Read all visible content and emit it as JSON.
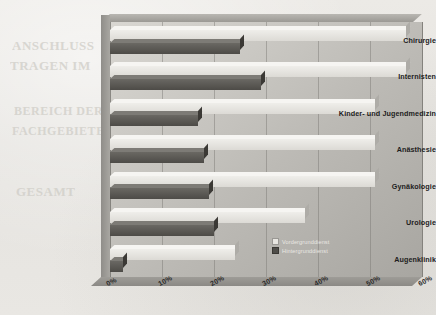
{
  "chart_data": {
    "type": "bar",
    "orientation": "horizontal",
    "title": "",
    "xlabel": "",
    "ylabel": "",
    "xlim": [
      0,
      60
    ],
    "xticks": [
      "0%",
      "10%",
      "20%",
      "30%",
      "40%",
      "50%",
      "60%"
    ],
    "xtick_values": [
      0,
      10,
      20,
      30,
      40,
      50,
      60
    ],
    "grid": true,
    "legend_position": "inside-right",
    "categories": [
      "Chirurgie",
      "Internisten",
      "Kinder- und Jugendmedizin",
      "Anästhesie",
      "Gynäkologie",
      "Urologie",
      "Augenklinik"
    ],
    "series": [
      {
        "name": "Vordergrunddienst",
        "color": "#e8e6e1",
        "values": [
          57,
          57,
          51,
          51,
          51,
          37.5,
          24
        ]
      },
      {
        "name": "Hintergrunddienst",
        "color": "#4f4d49",
        "values": [
          25,
          29,
          17,
          18,
          19,
          20,
          2.5
        ]
      }
    ]
  },
  "legend": {
    "items": [
      {
        "label": "Vordergrunddienst",
        "swatch": "light"
      },
      {
        "label": "Hintergrunddienst",
        "swatch": "dark"
      }
    ]
  },
  "bleed_text": {
    "lines": [
      "ANSCHLUSS",
      "TRAGEN IM",
      "BEREICH DER",
      "FACHGEBIETE",
      "GESAMT"
    ]
  }
}
